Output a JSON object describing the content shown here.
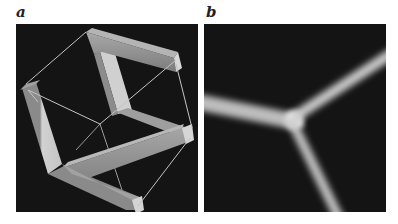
{
  "figure": {
    "panels": [
      {
        "id": "a",
        "label": "a",
        "description": "3D rendering of connected square bars inside a wireframe cube"
      },
      {
        "id": "b",
        "label": "b",
        "description": "Blurred three-armed junction image"
      }
    ],
    "colors": {
      "background": "#141414",
      "bar_light": "#c9c9c9",
      "bar_mid": "#9a9a9a",
      "bar_dark": "#6e6e6e",
      "wire": "#bdbdbd",
      "glow": "#cfcfcf"
    }
  }
}
